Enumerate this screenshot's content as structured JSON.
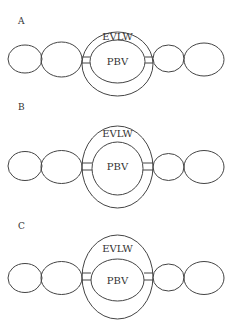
{
  "figure": {
    "stroke_color": "#444444",
    "text_color": "#333333",
    "background": "#ffffff"
  },
  "panels": [
    {
      "id": "A",
      "label": "A",
      "label_pos": [
        18,
        24
      ],
      "outer_label": "EVLW",
      "inner_label": "PBV",
      "outer": {
        "cx": 117.5,
        "cy": 64,
        "rx": 35.5,
        "ry": 32
      },
      "inner": {
        "cx": 117.5,
        "cy": 61.5,
        "rx": 27.5,
        "ry": 21.5
      },
      "outer_label_pos": [
        117.5,
        37
      ],
      "inner_label_pos": [
        117.5,
        62
      ],
      "lobes": [
        {
          "cx": 25,
          "cy": 59,
          "rx": 17,
          "ry": 14
        },
        {
          "cx": 61.5,
          "cy": 59.5,
          "rx": 20.5,
          "ry": 17.5
        },
        {
          "cx": 168.5,
          "cy": 58.5,
          "rx": 15.5,
          "ry": 13.5
        },
        {
          "cx": 204,
          "cy": 59.5,
          "rx": 20,
          "ry": 16.5
        }
      ],
      "connectors": [
        {
          "x1": 82,
          "x2": 90,
          "y1": 57,
          "y2": 63
        },
        {
          "x1": 145,
          "x2": 153,
          "y1": 57,
          "y2": 63
        }
      ]
    },
    {
      "id": "B",
      "label": "B",
      "label_pos": [
        18,
        110
      ],
      "outer_label": "EVLW",
      "inner_label": "PBV",
      "outer": {
        "cx": 117.5,
        "cy": 167,
        "rx": 35.5,
        "ry": 41
      },
      "inner": {
        "cx": 117.5,
        "cy": 168.5,
        "rx": 25.5,
        "ry": 26.5
      },
      "outer_label_pos": [
        117.5,
        134
      ],
      "inner_label_pos": [
        117.5,
        167
      ],
      "lobes": [
        {
          "cx": 25,
          "cy": 166,
          "rx": 17,
          "ry": 14.5
        },
        {
          "cx": 61.5,
          "cy": 167,
          "rx": 20.5,
          "ry": 16.5
        },
        {
          "cx": 168.5,
          "cy": 167,
          "rx": 15.5,
          "ry": 13.5
        },
        {
          "cx": 204,
          "cy": 167,
          "rx": 20,
          "ry": 16.5
        }
      ],
      "connectors": [
        {
          "x1": 82,
          "x2": 92,
          "y1": 163,
          "y2": 170
        },
        {
          "x1": 143,
          "x2": 153,
          "y1": 163,
          "y2": 170
        }
      ]
    },
    {
      "id": "C",
      "label": "C",
      "label_pos": [
        18,
        229
      ],
      "outer_label": "EVLW",
      "inner_label": "PBV",
      "outer": {
        "cx": 117.5,
        "cy": 277,
        "rx": 35.5,
        "ry": 42
      },
      "inner": {
        "cx": 117.5,
        "cy": 280,
        "rx": 26.5,
        "ry": 21
      },
      "outer_label_pos": [
        117.5,
        249
      ],
      "inner_label_pos": [
        117.5,
        281
      ],
      "lobes": [
        {
          "cx": 25,
          "cy": 278,
          "rx": 17,
          "ry": 14.5
        },
        {
          "cx": 61.5,
          "cy": 278,
          "rx": 20.5,
          "ry": 16.5
        },
        {
          "cx": 168.5,
          "cy": 277.5,
          "rx": 15.5,
          "ry": 13.5
        },
        {
          "cx": 204,
          "cy": 278,
          "rx": 20,
          "ry": 16.5
        }
      ],
      "connectors": [
        {
          "x1": 82,
          "x2": 91,
          "y1": 273,
          "y2": 280
        },
        {
          "x1": 144,
          "x2": 153,
          "y1": 273,
          "y2": 280
        }
      ]
    }
  ]
}
